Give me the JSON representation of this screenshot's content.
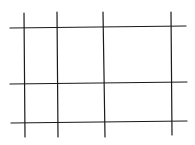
{
  "diagram": {
    "type": "grid-sketch",
    "stroke_color": "#1a1a1a",
    "background": "#ffffff",
    "vertical_lines": [
      {
        "x1": 24,
        "y1": 13,
        "x2": 25,
        "y2": 137
      },
      {
        "x1": 57,
        "y1": 12,
        "x2": 58,
        "y2": 137
      },
      {
        "x1": 103,
        "y1": 12,
        "x2": 105,
        "y2": 137
      },
      {
        "x1": 171,
        "y1": 12,
        "x2": 172,
        "y2": 135
      }
    ],
    "horizontal_lines": [
      {
        "x1": 10,
        "y1": 28,
        "x2": 186,
        "y2": 26
      },
      {
        "x1": 10,
        "y1": 84,
        "x2": 187,
        "y2": 82
      },
      {
        "x1": 11,
        "y1": 123,
        "x2": 187,
        "y2": 121
      }
    ]
  }
}
